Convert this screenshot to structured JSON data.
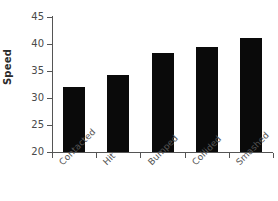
{
  "chart_data": {
    "type": "bar",
    "title": "",
    "subtitle": "",
    "xlabel": "",
    "ylabel": "Speed",
    "categories": [
      "Contacted",
      "Hit",
      "Bumped",
      "Collided",
      "Smashed"
    ],
    "values": [
      32.0,
      34.3,
      38.3,
      39.4,
      41.1
    ],
    "series": [
      {
        "name": "Speed",
        "values": [
          32.0,
          34.3,
          38.3,
          39.4,
          41.1
        ]
      }
    ],
    "ylim": [
      20,
      45
    ],
    "yticks": [
      20,
      25,
      30,
      35,
      40,
      45
    ],
    "ytick_labels": [
      "20",
      "25",
      "30",
      "35",
      "40",
      "45"
    ],
    "grid": false,
    "legend": false,
    "legend_position": "none",
    "bar_color": "#0a0a0a",
    "axis_color": "#555555",
    "background_color": "#ffffff",
    "xtick_label_rotation": -45
  },
  "axes": {
    "y_title": "Speed"
  }
}
